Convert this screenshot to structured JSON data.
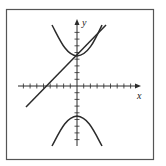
{
  "figure": {
    "type": "graph",
    "axes": {
      "x_label": "x",
      "y_label": "y",
      "x_ticks_negative": 9,
      "x_ticks_positive": 9,
      "y_ticks_positive": 10,
      "y_ticks_negative": 10
    },
    "curves": [
      {
        "name": "hyperbola-upper-branch",
        "vertex": [
          0,
          4.5
        ]
      },
      {
        "name": "hyperbola-lower-branch",
        "vertex": [
          0,
          -4.5
        ]
      },
      {
        "name": "line",
        "y_intercept": 4.5,
        "x_intercept": -4.3
      }
    ],
    "colors": {
      "stroke": "#2b2b2b",
      "frame": "#555555",
      "background": "#ffffff"
    }
  }
}
